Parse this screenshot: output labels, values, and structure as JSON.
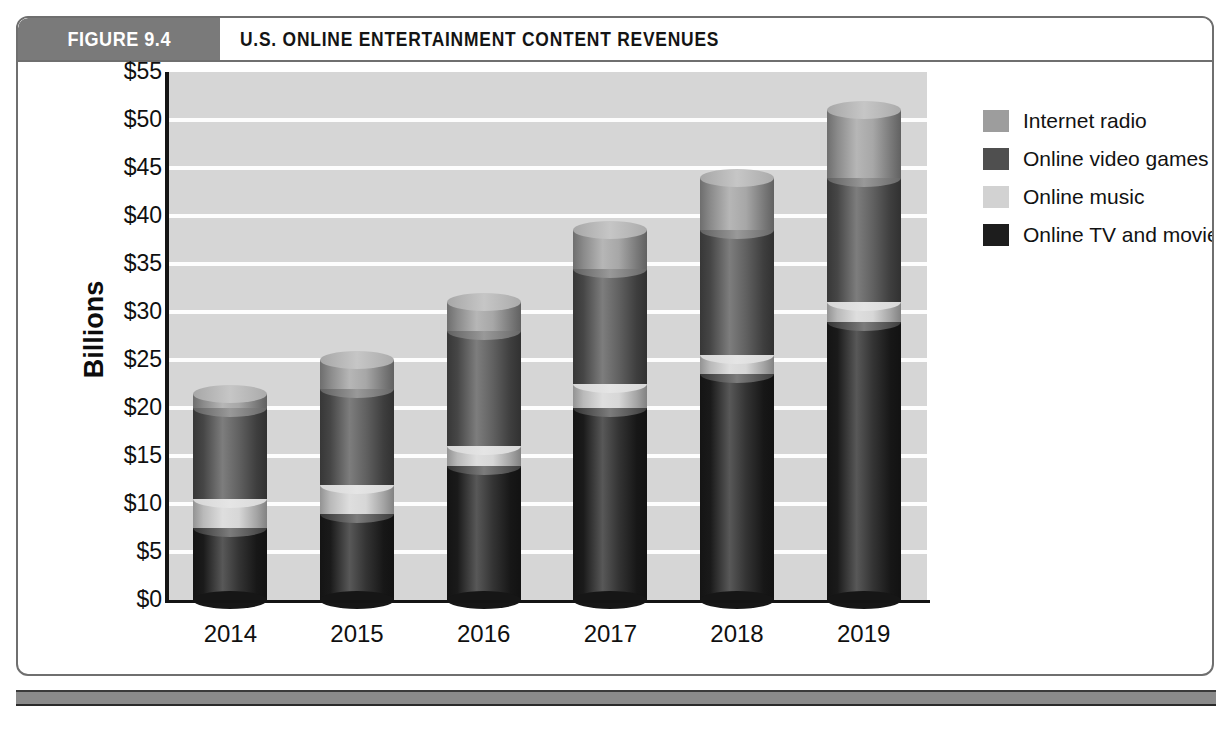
{
  "figure": {
    "tab_label": "FIGURE 9.4",
    "title": "U.S. ONLINE ENTERTAINMENT CONTENT REVENUES"
  },
  "colors": {
    "tab_background": "#7a7a7a",
    "plot_background": "#d6d6d6",
    "gridline": "#fdfdfd",
    "axis": "#141414",
    "footer_bar": "#8a8a8a",
    "internet_radio": "#9d9d9d",
    "online_video_games": "#4f4f4f",
    "online_music": "#d2d2d2",
    "online_tv_and_movies": "#1d1d1d"
  },
  "chart_data": {
    "type": "bar",
    "stacked": true,
    "title": "U.S. ONLINE ENTERTAINMENT CONTENT REVENUES",
    "xlabel": "",
    "ylabel": "Billions",
    "ylim": [
      0,
      55
    ],
    "ytick_step": 5,
    "grid": true,
    "legend_position": "right",
    "categories": [
      "2014",
      "2015",
      "2016",
      "2017",
      "2018",
      "2019"
    ],
    "ytick_labels": [
      "$55",
      "$50",
      "$45",
      "$40",
      "$35",
      "$30",
      "$25",
      "$20",
      "$15",
      "$10",
      "$5",
      "$0"
    ],
    "ytick_values": [
      55,
      50,
      45,
      40,
      35,
      30,
      25,
      20,
      15,
      10,
      5,
      0
    ],
    "series": [
      {
        "name": "Online TV and movies",
        "color": "#1d1d1d",
        "values": [
          7.5,
          9,
          14,
          20,
          23.5,
          29
        ]
      },
      {
        "name": "Online music",
        "color": "#d2d2d2",
        "values": [
          3,
          3,
          2,
          2.5,
          2,
          2
        ]
      },
      {
        "name": "Online video games",
        "color": "#4f4f4f",
        "values": [
          9.5,
          10,
          12,
          12,
          13,
          13
        ]
      },
      {
        "name": "Internet radio",
        "color": "#9d9d9d",
        "values": [
          1.5,
          3,
          3,
          4,
          5.5,
          7
        ]
      }
    ],
    "totals": [
      21.5,
      25,
      31,
      38.5,
      44,
      51
    ],
    "legend_order": [
      "Internet radio",
      "Online video games",
      "Online music",
      "Online TV and movies"
    ]
  },
  "legend": {
    "items": [
      {
        "label": "Internet radio",
        "color": "#9d9d9d"
      },
      {
        "label": "Online video games",
        "color": "#4f4f4f"
      },
      {
        "label": "Online music",
        "color": "#d2d2d2"
      },
      {
        "label": "Online TV and movies",
        "color": "#1d1d1d"
      }
    ]
  }
}
